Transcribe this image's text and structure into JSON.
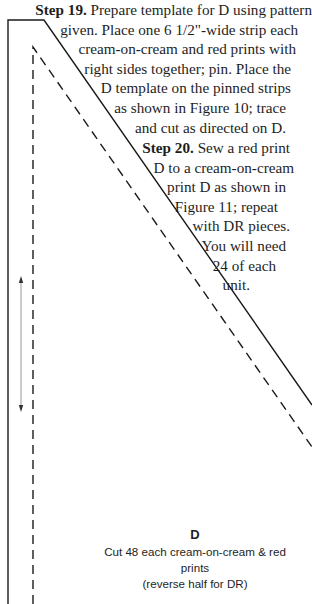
{
  "step19": {
    "heading": "Step 19.",
    "lines": [
      " Prepare template for D using pattern",
      "given. Place one 6 1/2\"-wide strip each",
      "cream-on-cream and red prints with",
      "right sides together; pin. Place the",
      "D template on the pinned strips",
      "as shown in Figure 10; trace",
      "and cut as directed on D."
    ]
  },
  "step20": {
    "heading": "Step 20.",
    "lines": [
      " Sew a red print",
      "D to a cream-on-cream",
      "print D as shown in",
      "Figure 11; repeat",
      "with DR pieces.",
      "You will need",
      "24 of each",
      "unit."
    ]
  },
  "template": {
    "piece_label": "D",
    "cut_instruction_line1": "Cut 48 each cream-on-cream & red prints",
    "cut_instruction_line2": "(reverse half for DR)",
    "icons": {
      "outline": "cutting-line-solid",
      "seam": "seam-line-dashed",
      "grain": "grainline-double-arrow"
    }
  }
}
